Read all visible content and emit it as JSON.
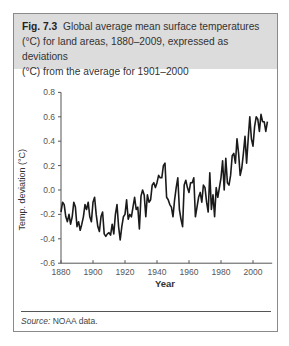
{
  "figure": {
    "label": "Fig. 7.3",
    "caption": "Global average mean surface temperatures (°C) for land areas, 1880–2009, expressed as deviations (°C) from the average for 1901–2000",
    "caption_lines": [
      "Global average mean surface temperatures",
      "(°C) for land areas, 1880–2009, expressed as deviations",
      "(°C) from the average for 1901–2000"
    ],
    "source_label": "Source:",
    "source_text": "NOAA data."
  },
  "chart_data": {
    "type": "line",
    "title": "Global average mean surface temperatures (°C) for land areas, 1880–2009, expressed as deviations (°C) from the average for 1901–2000",
    "xlabel": "Year",
    "ylabel": "Temp. deviation (°C)",
    "xlim": [
      1880,
      2012
    ],
    "ylim": [
      -0.6,
      0.8
    ],
    "xticks": [
      1880,
      1900,
      1920,
      1940,
      1960,
      1980,
      2000
    ],
    "yticks": [
      -0.6,
      -0.4,
      -0.2,
      0.0,
      0.2,
      0.4,
      0.6,
      0.8
    ],
    "ytick_labels": [
      "-0.6",
      "-0.4",
      "-0.2",
      "0.0",
      "0.2",
      "0.4",
      "0.6",
      "0.8"
    ],
    "grid": false,
    "legend": null,
    "series": [
      {
        "name": "Land temperature deviation",
        "x": [
          1880,
          1881,
          1882,
          1883,
          1884,
          1885,
          1886,
          1887,
          1888,
          1889,
          1890,
          1891,
          1892,
          1893,
          1894,
          1895,
          1896,
          1897,
          1898,
          1899,
          1900,
          1901,
          1902,
          1903,
          1904,
          1905,
          1906,
          1907,
          1908,
          1909,
          1910,
          1911,
          1912,
          1913,
          1914,
          1915,
          1916,
          1917,
          1918,
          1919,
          1920,
          1921,
          1922,
          1923,
          1924,
          1925,
          1926,
          1927,
          1928,
          1929,
          1930,
          1931,
          1932,
          1933,
          1934,
          1935,
          1936,
          1937,
          1938,
          1939,
          1940,
          1941,
          1942,
          1943,
          1944,
          1945,
          1946,
          1947,
          1948,
          1949,
          1950,
          1951,
          1952,
          1953,
          1954,
          1955,
          1956,
          1957,
          1958,
          1959,
          1960,
          1961,
          1962,
          1963,
          1964,
          1965,
          1966,
          1967,
          1968,
          1969,
          1970,
          1971,
          1972,
          1973,
          1974,
          1975,
          1976,
          1977,
          1978,
          1979,
          1980,
          1981,
          1982,
          1983,
          1984,
          1985,
          1986,
          1987,
          1988,
          1989,
          1990,
          1991,
          1992,
          1993,
          1994,
          1995,
          1996,
          1997,
          1998,
          1999,
          2000,
          2001,
          2002,
          2003,
          2004,
          2005,
          2006,
          2007,
          2008,
          2009
        ],
        "values": [
          -0.18,
          -0.1,
          -0.12,
          -0.22,
          -0.26,
          -0.2,
          -0.28,
          -0.22,
          -0.1,
          -0.14,
          -0.3,
          -0.26,
          -0.33,
          -0.28,
          -0.22,
          -0.12,
          -0.16,
          -0.1,
          -0.22,
          -0.26,
          -0.1,
          -0.06,
          -0.2,
          -0.3,
          -0.34,
          -0.22,
          -0.18,
          -0.36,
          -0.38,
          -0.36,
          -0.35,
          -0.37,
          -0.28,
          -0.36,
          -0.2,
          -0.12,
          -0.3,
          -0.41,
          -0.3,
          -0.22,
          -0.2,
          -0.08,
          -0.24,
          -0.2,
          -0.22,
          -0.14,
          -0.06,
          -0.16,
          -0.14,
          -0.32,
          -0.05,
          0.0,
          -0.04,
          -0.22,
          -0.04,
          -0.1,
          -0.08,
          0.04,
          0.06,
          0.02,
          0.06,
          0.12,
          0.1,
          0.1,
          0.2,
          0.22,
          -0.06,
          -0.08,
          -0.12,
          -0.14,
          -0.22,
          -0.08,
          0.02,
          0.1,
          -0.16,
          -0.24,
          -0.3,
          0.04,
          0.08,
          0.02,
          -0.02,
          0.06,
          0.06,
          0.1,
          -0.22,
          -0.14,
          -0.06,
          -0.02,
          -0.1,
          0.04,
          0.02,
          -0.1,
          -0.18,
          0.14,
          -0.16,
          -0.04,
          -0.22,
          0.02,
          -0.06,
          0.02,
          0.1,
          0.24,
          0.0,
          0.26,
          0.06,
          0.04,
          0.12,
          0.28,
          0.3,
          0.22,
          0.42,
          0.3,
          0.12,
          0.18,
          0.3,
          0.44,
          0.22,
          0.42,
          0.6,
          0.42,
          0.36,
          0.52,
          0.6,
          0.58,
          0.48,
          0.62,
          0.56,
          0.56,
          0.48,
          0.56
        ]
      }
    ]
  }
}
